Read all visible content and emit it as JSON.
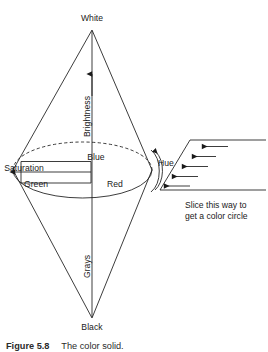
{
  "figure": {
    "caption_number": "Figure 5.8",
    "caption_text": "The color solid."
  },
  "diagram": {
    "apex_top_label": "White",
    "apex_bottom_label": "Black",
    "vertical_axis_upper_label": "Brightness",
    "vertical_axis_lower_label": "Grays",
    "radial_label": "Saturation",
    "circumference_label": "Hue",
    "hue_labels": [
      "Blue",
      "Green",
      "Red"
    ],
    "hue_blue": "Blue",
    "hue_green": "Green",
    "hue_red": "Red"
  },
  "slice_diagram": {
    "caption_line_1": "Slice this way to",
    "caption_line_2": "get a color circle",
    "arrow_count": 5,
    "arrow_direction": "left"
  },
  "style": {
    "line_color": "#1a1a1a",
    "background": "#ffffff",
    "text_color": "#1a1a1a"
  }
}
